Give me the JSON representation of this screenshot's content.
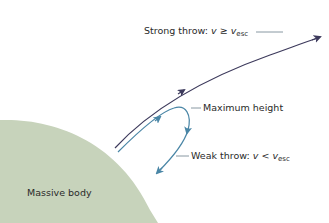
{
  "diagram": {
    "type": "escape-velocity",
    "colors": {
      "body_fill": "#c7d3bb",
      "strong_path": "#3d3a5c",
      "weak_path": "#4a86a6",
      "leader": "#6a7f8c",
      "text": "#2a2a2a"
    },
    "labels": {
      "strong_prefix": "Strong throw:",
      "strong_var": "v",
      "strong_op": "≥",
      "strong_var2": "v",
      "strong_sub": "esc",
      "max_height": "Maximum height",
      "weak_prefix": "Weak throw:",
      "weak_var": "v",
      "weak_op": "<",
      "weak_var2": "v",
      "weak_sub": "esc",
      "body": "Massive body"
    }
  }
}
